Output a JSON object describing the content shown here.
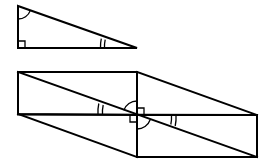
{
  "diagram": {
    "stroke_color": "#000000",
    "background": "#ffffff",
    "small_triangle": {
      "vertices": {
        "top": [
          18,
          6
        ],
        "right_angle": [
          18,
          48
        ],
        "acute": [
          137,
          48
        ]
      },
      "marks": [
        {
          "type": "right-angle",
          "at": "right_angle"
        },
        {
          "type": "single-arc",
          "at": "top"
        },
        {
          "type": "double-arc",
          "at": "acute"
        }
      ]
    },
    "large_figure": {
      "vertices": {
        "top_left": [
          18,
          72
        ],
        "top_mid": [
          137,
          72
        ],
        "left_bottom": [
          18,
          114
        ],
        "center": [
          137,
          115
        ],
        "right_top": [
          257,
          115
        ],
        "bottom_mid": [
          137,
          157
        ],
        "bottom_right": [
          257,
          157
        ]
      },
      "marks": [
        {
          "type": "double-arc",
          "at": "left diagonal angle"
        },
        {
          "type": "double-arc",
          "at": "right diagonal angle"
        },
        {
          "type": "single-arc",
          "at": "center upper-left"
        },
        {
          "type": "single-arc",
          "at": "center lower-right"
        },
        {
          "type": "right-angle",
          "at": "center upper-right"
        },
        {
          "type": "right-angle",
          "at": "center lower-left"
        }
      ]
    }
  }
}
